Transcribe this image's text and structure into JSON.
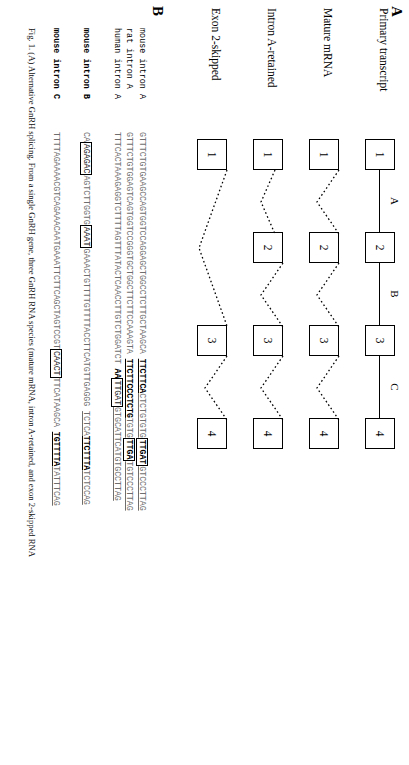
{
  "figure": {
    "panel_a_letter": "A",
    "panel_b_letter": "B",
    "caption": "Fig. 1. (A) Alternative GnRH splicing. From a single GnRH gene, three GnRH RNA species (mature mRNA, intron A-retained, and exon 2-skipped RNA"
  },
  "panel_a": {
    "tracks": [
      {
        "label": "Primary transcript",
        "exons": [
          "1",
          "2",
          "3",
          "4"
        ],
        "introns": [
          "A",
          "B",
          "C"
        ],
        "style": "line"
      },
      {
        "label": "Mature mRNA",
        "exons": [
          "1",
          "2",
          "3",
          "4"
        ],
        "introns": [
          "",
          "",
          ""
        ],
        "style": "spliced"
      },
      {
        "label": "Intron A-retained",
        "exons": [
          "1",
          "2",
          "3",
          "4"
        ],
        "introns": [
          "",
          "",
          ""
        ],
        "style": "spliced-a-retained"
      },
      {
        "label": "Exon 2-skipped",
        "exons": [
          "1",
          "3",
          "4"
        ],
        "introns": [
          "",
          ""
        ],
        "style": "spliced-skip2"
      }
    ]
  },
  "panel_b": {
    "rows": [
      {
        "name": "mouse intron A",
        "bold_name": false,
        "segments": [
          {
            "text": "GTTTCTGTGAAGCCAGTGGTCCAGGAGCTGGCCTCTTGCTAAGCA ",
            "style": "gray"
          },
          {
            "text": "TTCTTCA",
            "style": "ul-dark"
          },
          {
            "text": "CTCTGTGTG",
            "style": "ul-gray"
          },
          {
            "text": "TTGAT",
            "style": "boxed"
          },
          {
            "text": "GTCCCTTAG",
            "style": "ul-gray"
          }
        ]
      },
      {
        "name": "rat intron A",
        "bold_name": false,
        "segments": [
          {
            "text": "GTTTCTGTGGAGTCAGTGGTCCGGGTGCTGGCTTCTTCCAAAGTA ",
            "style": "gray"
          },
          {
            "text": "TTCTTCCCTCTG",
            "style": "ul-dark"
          },
          {
            "text": "TGTG",
            "style": "ul-gray"
          },
          {
            "text": "TTGA",
            "style": "boxed"
          },
          {
            "text": "TGTCCCTTAG",
            "style": "ul-gray"
          }
        ]
      },
      {
        "name": "human intron A",
        "bold_name": false,
        "segments": [
          {
            "text": "TTTCACTAAAGAGGTCTTTTAGTTTATACTCAACCTTGTCTGGATCT ",
            "style": "gray"
          },
          {
            "text": "AA",
            "style": "bold"
          },
          {
            "text": "TTGAT",
            "style": "boxed-plain"
          },
          {
            "text": "GTGCATTCATGTGCCTTAG",
            "style": "ul-gray"
          }
        ]
      },
      {
        "name": "mouse intron B",
        "bold_name": true,
        "segments": [
          {
            "text": "CA",
            "style": "gray"
          },
          {
            "text": "AGAGAC",
            "style": "boxed-plain"
          },
          {
            "text": "AGTCTTGGTG",
            "style": "gray"
          },
          {
            "text": "AAAT",
            "style": "boxed-plain"
          },
          {
            "text": "GAAACTGTTTTGTTTTACCTTCATGTTGAGGG ",
            "style": "gray"
          },
          {
            "text": "TCTCA",
            "style": "ul-gray"
          },
          {
            "text": "TTCTTTA",
            "style": "ul-dark"
          },
          {
            "text": "TCTCCAG",
            "style": "ul-gray"
          }
        ]
      },
      {
        "name": "mouse intron C",
        "bold_name": true,
        "segments": [
          {
            "text": "TTTTAGAAAACGTCAGAAACAATGAAATTCTTCAGCTAGTCCGT",
            "style": "gray"
          },
          {
            "text": "CAACT",
            "style": "boxed-plain"
          },
          {
            "text": "TTCATAAGCA ",
            "style": "gray"
          },
          {
            "text": "TGTTTTA",
            "style": "ul-dark"
          },
          {
            "text": "TATTTCAG",
            "style": "ul-gray"
          }
        ]
      }
    ]
  }
}
